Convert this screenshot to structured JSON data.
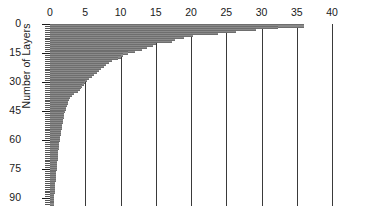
{
  "chart_data": {
    "type": "bar",
    "orientation": "horizontal",
    "title": "",
    "xlabel": "",
    "ylabel": "Number of Layers",
    "xlim": [
      0,
      40
    ],
    "ylim": [
      0,
      93
    ],
    "grid": "vertical gridlines at each x tick",
    "legend": "none",
    "bar_color": "#8a8a8a",
    "xticks": [
      0,
      5,
      10,
      15,
      20,
      25,
      30,
      35,
      40
    ],
    "yticks": [
      0,
      15,
      30,
      45,
      60,
      75,
      90
    ],
    "ytick_minor_interval": 1,
    "categories": [
      0,
      1,
      2,
      3,
      4,
      5,
      6,
      7,
      8,
      9,
      10,
      11,
      12,
      13,
      14,
      15,
      16,
      17,
      18,
      19,
      20,
      21,
      22,
      23,
      24,
      25,
      26,
      27,
      28,
      29,
      30,
      31,
      32,
      33,
      34,
      35,
      36,
      37,
      38,
      39,
      40,
      41,
      42,
      43,
      44,
      45,
      46,
      47,
      48,
      49,
      50,
      51,
      52,
      53,
      54,
      55,
      56,
      57,
      58,
      59,
      60,
      61,
      62,
      63,
      64,
      65,
      66,
      67,
      68,
      69,
      70,
      71,
      72,
      73,
      74,
      75,
      76,
      77,
      78,
      79,
      80,
      81,
      82,
      83,
      84,
      85,
      86,
      87,
      88,
      89,
      90,
      91,
      92
    ],
    "values": [
      36.0,
      32.3,
      29.2,
      26.4,
      23.8,
      20.3,
      19.0,
      17.7,
      17.3,
      15.0,
      14.6,
      13.8,
      13.0,
      12.0,
      11.0,
      10.3,
      10.0,
      9.6,
      8.8,
      8.4,
      8.0,
      7.7,
      7.3,
      7.0,
      6.6,
      6.3,
      6.0,
      5.6,
      5.3,
      5.0,
      4.8,
      4.6,
      4.4,
      4.2,
      4.0,
      3.4,
      3.1,
      2.9,
      2.7,
      2.6,
      2.5,
      2.4,
      2.3,
      2.2,
      2.1,
      2.05,
      2.0,
      1.95,
      1.9,
      1.85,
      1.8,
      1.75,
      1.7,
      1.65,
      1.6,
      1.55,
      1.5,
      1.45,
      1.4,
      1.35,
      1.3,
      1.28,
      1.25,
      1.22,
      1.2,
      1.18,
      1.15,
      1.12,
      1.1,
      1.08,
      1.05,
      1.03,
      1.0,
      0.98,
      0.95,
      0.92,
      0.9,
      0.88,
      0.85,
      0.82,
      0.8,
      0.78,
      0.75,
      0.72,
      0.7,
      0.68,
      0.65,
      0.62,
      0.6,
      0.58,
      0.55,
      0.52,
      0.5
    ]
  }
}
